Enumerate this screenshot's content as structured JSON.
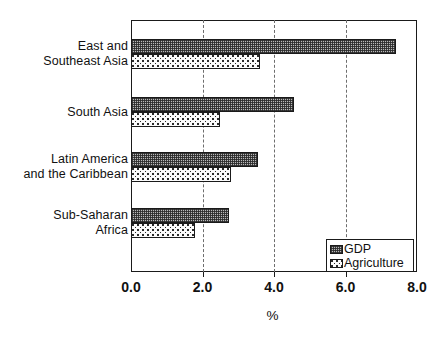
{
  "chart_data": {
    "type": "bar",
    "orientation": "horizontal",
    "title": "",
    "xlabel": "%",
    "ylabel": "",
    "xlim": [
      0.0,
      8.0
    ],
    "xticks": [
      "0.0",
      "2.0",
      "4.0",
      "6.0",
      "8.0"
    ],
    "xtick_values": [
      0.0,
      2.0,
      4.0,
      6.0,
      8.0
    ],
    "gridlines": [
      2.0,
      4.0,
      6.0
    ],
    "grid": true,
    "legend_position": "bottom-right",
    "categories": [
      "East  and\nSoutheast Asia",
      "South Asia",
      "Latin America\nand the Caribbean",
      "Sub-Saharan\nAfrica"
    ],
    "series": [
      {
        "name": "GDP",
        "pattern": "crosshatch",
        "values": [
          7.4,
          4.55,
          3.55,
          2.75
        ]
      },
      {
        "name": "Agriculture",
        "pattern": "dots",
        "values": [
          3.6,
          2.5,
          2.8,
          1.8
        ]
      }
    ]
  },
  "legend": {
    "items": [
      {
        "label": "GDP",
        "swatch": "crosshatch-swatch"
      },
      {
        "label": "Agriculture",
        "swatch": "dots-swatch"
      }
    ]
  },
  "colors": {
    "axis": "#1a1a1a",
    "grid": "#6d6d6d",
    "gdp_fill": "#b9b9b9",
    "agriculture_fill": "#fbfbfb",
    "text": "#111111",
    "background": "#ffffff"
  }
}
